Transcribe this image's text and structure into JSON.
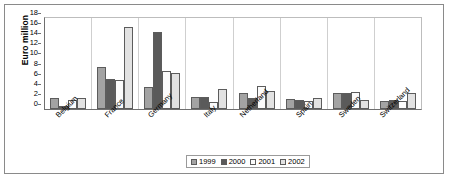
{
  "chart_data": {
    "type": "bar",
    "title": "",
    "xlabel": "",
    "ylabel": "Euro million",
    "ylim": [
      0,
      18
    ],
    "ytick_step": 2,
    "yticks": [
      "0",
      "2",
      "4",
      "6",
      "8",
      "10",
      "12",
      "14",
      "16",
      "18"
    ],
    "grid": false,
    "legend_position": "bottom",
    "categories": [
      "Belgium",
      "France",
      "Germany",
      "Italy",
      "Netherland",
      "Spain",
      "Sweden",
      "Switzerland"
    ],
    "series": [
      {
        "name": "1999",
        "color": "#a3a3a3",
        "values": [
          2.2,
          8.4,
          4.3,
          2.3,
          3.1,
          2.0,
          3.1,
          1.6
        ]
      },
      {
        "name": "2000",
        "color": "#5a5a5a",
        "values": [
          0.6,
          5.9,
          15.2,
          2.4,
          2.1,
          1.7,
          3.2,
          1.8
        ]
      },
      {
        "name": "2001",
        "color": "#fbfbfb",
        "values": [
          1.8,
          5.8,
          7.6,
          1.3,
          4.5,
          1.5,
          3.3,
          1.6
        ]
      },
      {
        "name": "2002",
        "color": "#e2e2e2",
        "values": [
          2.2,
          16.3,
          7.1,
          4.0,
          3.5,
          2.1,
          1.8,
          3.1
        ]
      }
    ]
  }
}
